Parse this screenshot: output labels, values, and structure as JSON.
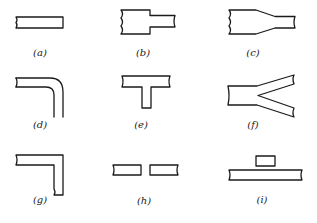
{
  "figure": {
    "panels": [
      {
        "id": "a",
        "label": "(a)",
        "shape": "open-end strip"
      },
      {
        "id": "b",
        "label": "(b)",
        "shape": "step in width"
      },
      {
        "id": "c",
        "label": "(c)",
        "shape": "tapered width transition"
      },
      {
        "id": "d",
        "label": "(d)",
        "shape": "curved bend"
      },
      {
        "id": "e",
        "label": "(e)",
        "shape": "T-junction"
      },
      {
        "id": "f",
        "label": "(f)",
        "shape": "Y-junction"
      },
      {
        "id": "g",
        "label": "(g)",
        "shape": "right-angle bend"
      },
      {
        "id": "h",
        "label": "(h)",
        "shape": "series gap"
      },
      {
        "id": "i",
        "label": "(i)",
        "shape": "coupled overlay patch"
      }
    ],
    "stroke_color": "#1a1a1a",
    "background": "#ffffff"
  }
}
